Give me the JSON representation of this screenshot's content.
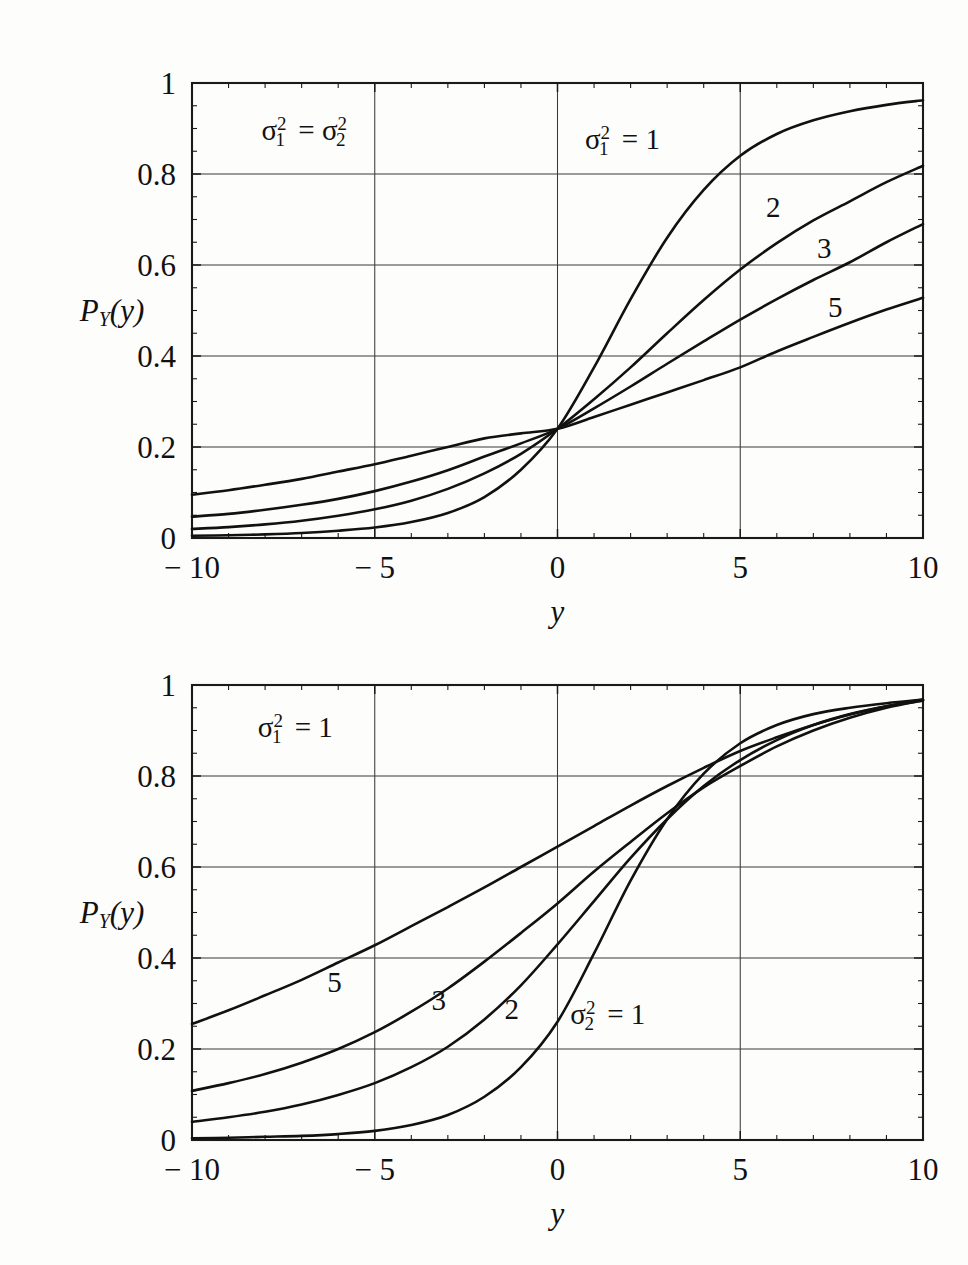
{
  "figure": {
    "background": "#fdfdfb",
    "ink": "#111111",
    "panel_count": 2
  },
  "chart_data": [
    {
      "id": "top-panel",
      "type": "line",
      "title": "",
      "xlabel": "y",
      "ylabel": "P_Y(y)",
      "ylabel_display": "P",
      "ylabel_sub": "Y",
      "ylabel_tail": "(y)",
      "xlim": [
        -10,
        10
      ],
      "ylim": [
        0,
        1
      ],
      "grid": true,
      "xticks": [
        -10,
        -5,
        0,
        5,
        10
      ],
      "xticklabels": [
        "− 10",
        "− 5",
        "0",
        "5",
        "10"
      ],
      "yticks": [
        0,
        0.2,
        0.4,
        0.6,
        0.8,
        1
      ],
      "yticklabels": [
        "0",
        "0.2",
        "0.4",
        "0.6",
        "0.8",
        "1"
      ],
      "minor_x_per_major": 5,
      "minor_y_per_major": 4,
      "legend_position": "in-plot-labels",
      "annotations": [
        {
          "name": "variance-equality-note",
          "text_parts": {
            "sigma": "σ",
            "sub": "1",
            "sup": "2",
            "eq": "=",
            "sigma2": "σ",
            "sub2": "2",
            "sup2": "2"
          },
          "x": -8.1,
          "y": 0.875
        },
        {
          "name": "sigma1-equals-one-note",
          "text_parts": {
            "sigma": "σ",
            "sub": "1",
            "sup": "2",
            "eq": "= 1"
          },
          "x": 0.75,
          "y": 0.855
        }
      ],
      "curve_labels": [
        {
          "label": "2",
          "x": 5.9,
          "y": 0.705
        },
        {
          "label": "3",
          "x": 7.3,
          "y": 0.615
        },
        {
          "label": "5",
          "x": 7.6,
          "y": 0.485
        }
      ],
      "series": [
        {
          "name": "sigma1sq=1",
          "label": "σ₁² = 1",
          "x": [
            -10,
            -9,
            -8,
            -7,
            -6,
            -5,
            -4,
            -3,
            -2,
            -1,
            0,
            1,
            2,
            3,
            4,
            5,
            6,
            7,
            8,
            9,
            10
          ],
          "values": [
            0.005,
            0.006,
            0.008,
            0.011,
            0.016,
            0.023,
            0.035,
            0.055,
            0.09,
            0.15,
            0.24,
            0.375,
            0.525,
            0.66,
            0.765,
            0.84,
            0.888,
            0.918,
            0.938,
            0.952,
            0.962
          ]
        },
        {
          "name": "sigma1sq=2",
          "label": "2",
          "x": [
            -10,
            -9,
            -8,
            -7,
            -6,
            -5,
            -4,
            -3,
            -2,
            -1,
            0,
            1,
            2,
            3,
            4,
            5,
            6,
            7,
            8,
            9,
            10
          ],
          "values": [
            0.02,
            0.024,
            0.03,
            0.038,
            0.049,
            0.063,
            0.082,
            0.108,
            0.142,
            0.185,
            0.24,
            0.305,
            0.375,
            0.45,
            0.523,
            0.59,
            0.648,
            0.698,
            0.74,
            0.782,
            0.818
          ]
        },
        {
          "name": "sigma1sq=3",
          "label": "3",
          "x": [
            -10,
            -9,
            -8,
            -7,
            -6,
            -5,
            -4,
            -3,
            -2,
            -1,
            0,
            1,
            2,
            3,
            4,
            5,
            6,
            7,
            8,
            9,
            10
          ],
          "values": [
            0.047,
            0.053,
            0.062,
            0.073,
            0.086,
            0.103,
            0.124,
            0.149,
            0.179,
            0.208,
            0.24,
            0.285,
            0.333,
            0.383,
            0.432,
            0.48,
            0.525,
            0.567,
            0.606,
            0.65,
            0.69
          ]
        },
        {
          "name": "sigma1sq=5",
          "label": "5",
          "x": [
            -10,
            -9,
            -8,
            -7,
            -6,
            -5,
            -4,
            -3,
            -2,
            -1,
            0,
            1,
            2,
            3,
            4,
            5,
            6,
            7,
            8,
            9,
            10
          ],
          "values": [
            0.095,
            0.105,
            0.117,
            0.13,
            0.146,
            0.162,
            0.181,
            0.2,
            0.219,
            0.23,
            0.24,
            0.266,
            0.293,
            0.32,
            0.347,
            0.375,
            0.41,
            0.442,
            0.473,
            0.502,
            0.528
          ]
        }
      ]
    },
    {
      "id": "bottom-panel",
      "type": "line",
      "title": "",
      "xlabel": "y",
      "ylabel": "P_Y(y)",
      "ylabel_display": "P",
      "ylabel_sub": "Y",
      "ylabel_tail": "(y)",
      "xlim": [
        -10,
        10
      ],
      "ylim": [
        0,
        1
      ],
      "grid": true,
      "xticks": [
        -10,
        -5,
        0,
        5,
        10
      ],
      "xticklabels": [
        "− 10",
        "− 5",
        "0",
        "5",
        "10"
      ],
      "yticks": [
        0,
        0.2,
        0.4,
        0.6,
        0.8,
        1
      ],
      "yticklabels": [
        "0",
        "0.2",
        "0.4",
        "0.6",
        "0.8",
        "1"
      ],
      "minor_x_per_major": 5,
      "minor_y_per_major": 4,
      "legend_position": "in-plot-labels",
      "annotations": [
        {
          "name": "sigma1-equals-one-note",
          "text_parts": {
            "sigma": "σ",
            "sub": "1",
            "sup": "2",
            "eq": "= 1"
          },
          "x": -8.2,
          "y": 0.885
        },
        {
          "name": "sigma2-equals-one-note",
          "text_parts": {
            "sigma": "σ",
            "sub": "2",
            "sup": "2",
            "eq": "= 1"
          },
          "x": 0.35,
          "y": 0.255
        }
      ],
      "curve_labels": [
        {
          "label": "5",
          "x": -6.1,
          "y": 0.325
        },
        {
          "label": "3",
          "x": -3.25,
          "y": 0.285
        },
        {
          "label": "2",
          "x": -1.25,
          "y": 0.265
        }
      ],
      "series": [
        {
          "name": "sigma2sq=1",
          "label": "σ₂² = 1",
          "x": [
            -10,
            -9,
            -8,
            -7,
            -6,
            -5,
            -4,
            -3,
            -2,
            -1,
            0,
            1,
            2,
            3,
            4,
            5,
            6,
            7,
            8,
            9,
            10
          ],
          "values": [
            0.004,
            0.005,
            0.007,
            0.009,
            0.013,
            0.02,
            0.033,
            0.055,
            0.095,
            0.16,
            0.26,
            0.41,
            0.57,
            0.705,
            0.805,
            0.872,
            0.912,
            0.936,
            0.95,
            0.96,
            0.968
          ]
        },
        {
          "name": "sigma2sq=2",
          "label": "2",
          "x": [
            -10,
            -9,
            -8,
            -7,
            -6,
            -5,
            -4,
            -3,
            -2,
            -1,
            0,
            1,
            2,
            3,
            4,
            5,
            6,
            7,
            8,
            9,
            10
          ],
          "values": [
            0.04,
            0.05,
            0.062,
            0.078,
            0.099,
            0.125,
            0.16,
            0.205,
            0.265,
            0.34,
            0.43,
            0.525,
            0.62,
            0.705,
            0.778,
            0.835,
            0.879,
            0.912,
            0.936,
            0.953,
            0.966
          ]
        },
        {
          "name": "sigma2sq=3",
          "label": "3",
          "x": [
            -10,
            -9,
            -8,
            -7,
            -6,
            -5,
            -4,
            -3,
            -2,
            -1,
            0,
            1,
            2,
            3,
            4,
            5,
            6,
            7,
            8,
            9,
            10
          ],
          "values": [
            0.108,
            0.125,
            0.145,
            0.17,
            0.2,
            0.237,
            0.282,
            0.333,
            0.392,
            0.455,
            0.52,
            0.59,
            0.655,
            0.718,
            0.775,
            0.822,
            0.865,
            0.9,
            0.928,
            0.95,
            0.966
          ]
        },
        {
          "name": "sigma2sq=5",
          "label": "5",
          "x": [
            -10,
            -9,
            -8,
            -7,
            -6,
            -5,
            -4,
            -3,
            -2,
            -1,
            0,
            1,
            2,
            3,
            4,
            5,
            6,
            7,
            8,
            9,
            10
          ],
          "values": [
            0.255,
            0.285,
            0.318,
            0.352,
            0.39,
            0.428,
            0.47,
            0.512,
            0.555,
            0.6,
            0.645,
            0.69,
            0.735,
            0.778,
            0.818,
            0.855,
            0.885,
            0.912,
            0.935,
            0.953,
            0.968
          ]
        }
      ]
    }
  ]
}
